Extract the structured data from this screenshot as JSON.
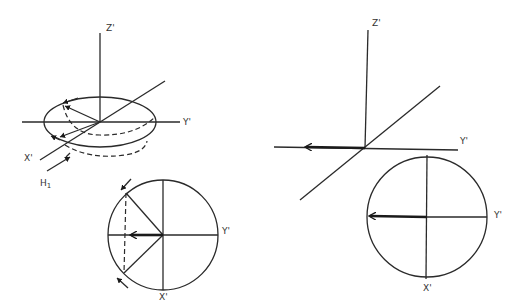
{
  "figure": {
    "panels": [
      {
        "id": "left-3d",
        "description": "Rotating frame with magnetization vector precessing in the x'-y' plane under H1",
        "labels": {
          "z": "Z'",
          "y": "Y'",
          "x": "X'",
          "field": "H",
          "field_sub": "1"
        }
      },
      {
        "id": "left-circle",
        "description": "Top view of x'-y' plane showing dephasing vectors and net magnetization",
        "labels": {
          "y": "Y'",
          "x": "X'"
        }
      },
      {
        "id": "right-3d",
        "description": "Rotating frame with net magnetization along -Y'",
        "labels": {
          "z": "Z'",
          "y": "Y'"
        }
      },
      {
        "id": "right-circle",
        "description": "Top view of x'-y' plane with single magnetization vector along -Y'",
        "labels": {
          "y": "Y'",
          "x": "X'"
        }
      }
    ],
    "colors": {
      "ink": "#2a2a2a",
      "background": "#ffffff"
    }
  }
}
